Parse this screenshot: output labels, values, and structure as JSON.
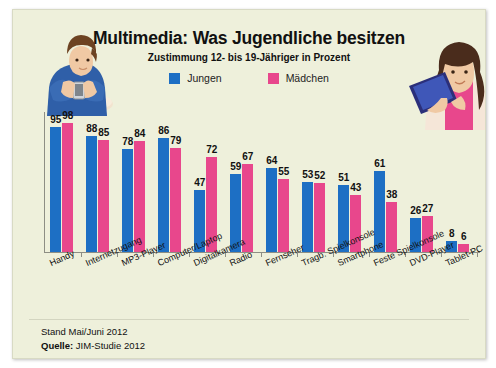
{
  "panel": {
    "background_color": "#eef0db"
  },
  "header": {
    "title": "Multimedia: Was Jugendliche besitzen",
    "subtitle": "Zustimmung 12- bis 19-Jähriger in Prozent"
  },
  "legend": [
    {
      "label": "Jungen",
      "color": "#1d6fc4"
    },
    {
      "label": "Mädchen",
      "color": "#e8478c"
    }
  ],
  "illustrations": [
    {
      "name": "boy-with-smartphone",
      "alt": "Junge mit Smartphone"
    },
    {
      "name": "girl-with-tablet",
      "alt": "Mädchen mit Tablet"
    }
  ],
  "footer": {
    "stand": "Stand Mai/Juni 2012",
    "source_label": "Quelle:",
    "source_value": "JIM-Studie 2012"
  },
  "chart_data": {
    "type": "bar",
    "title": "Multimedia: Was Jugendliche besitzen",
    "subtitle": "Zustimmung 12- bis 19-Jähriger in Prozent",
    "xlabel": "",
    "ylabel": "Prozent",
    "ylim": [
      0,
      100
    ],
    "grid": false,
    "legend_position": "top-center",
    "categories": [
      "Handy",
      "Internetzugang",
      "MP3-Player",
      "Computer/Laptop",
      "Digitalkamera",
      "Radio",
      "Fernseher",
      "Tragb. Spielkonsole",
      "Smartphone",
      "Feste Spielkonsole",
      "DVD-Player",
      "Tablet-PC"
    ],
    "series": [
      {
        "name": "Jungen",
        "color": "#1d6fc4",
        "values": [
          95,
          88,
          78,
          86,
          47,
          59,
          64,
          53,
          51,
          61,
          26,
          8
        ]
      },
      {
        "name": "Mädchen",
        "color": "#e8478c",
        "values": [
          98,
          85,
          84,
          79,
          72,
          67,
          55,
          52,
          43,
          38,
          27,
          6
        ]
      }
    ]
  }
}
